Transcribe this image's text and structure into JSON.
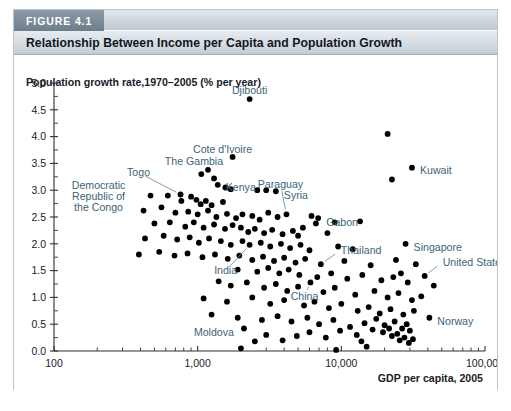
{
  "figure": {
    "tag": "FIGURE 4.1",
    "title": "Relationship Between Income per Capita and Population Growth"
  },
  "chart_data": {
    "type": "scatter",
    "title": "Relationship Between Income per Capita and Population Growth",
    "xlabel": "GDP per capita, 2005",
    "ylabel": "Population growth rate,1970–2005 (% per year)",
    "xscale": "log",
    "xlim": [
      100,
      100000
    ],
    "ylim": [
      0.0,
      5.0
    ],
    "grid": false,
    "legend": null,
    "xticks": [
      100,
      1000,
      10000,
      100000
    ],
    "xtick_labels": [
      "100",
      "1,000",
      "10,000",
      "100,000"
    ],
    "yticks": [
      0.0,
      0.5,
      1.0,
      1.5,
      2.0,
      2.5,
      3.0,
      3.5,
      4.0,
      4.5,
      5.0
    ],
    "ytick_labels": [
      "0.0",
      "0.5",
      "1.0",
      "1.5",
      "2.0",
      "2.5",
      "3.0",
      "3.5",
      "4.0",
      "4.5",
      "5.0"
    ],
    "annotations": [
      {
        "text": "Djibouti",
        "x": 2300,
        "y": 4.7,
        "label_dx": 0,
        "label_dy": -9,
        "anchor": "middle",
        "leader": false
      },
      {
        "text": "Cote d'Ivoire",
        "x": 1750,
        "y": 3.62,
        "label_dx": -10,
        "label_dy": -8,
        "anchor": "middle",
        "leader": false
      },
      {
        "text": "The Gambia",
        "x": 1180,
        "y": 3.38,
        "label_dx": -14,
        "label_dy": -8,
        "anchor": "middle",
        "leader": false
      },
      {
        "text": "Kuwait",
        "x": 31000,
        "y": 3.42,
        "label_dx": 8,
        "label_dy": 3,
        "anchor": "start",
        "leader": false
      },
      {
        "text": "Togo",
        "x": 760,
        "y": 2.92,
        "label_dx": -42,
        "label_dy": -22,
        "anchor": "middle",
        "leader": true
      },
      {
        "text": "Kenya",
        "x": 1380,
        "y": 3.1,
        "label_dx": 8,
        "label_dy": 3,
        "anchor": "start",
        "leader": false
      },
      {
        "text": "Syria",
        "x": 3500,
        "y": 2.98,
        "label_dx": 8,
        "label_dy": 4,
        "anchor": "start",
        "leader": false
      },
      {
        "text": "Paraguay",
        "x": 4150,
        "y": 2.55,
        "label_dx": -6,
        "label_dy": -30,
        "anchor": "middle",
        "leader": true
      },
      {
        "text": "Democratic",
        "x": 470,
        "y": 2.9,
        "label_dx": -52,
        "label_dy": -10,
        "anchor": "middle",
        "leader": false
      },
      {
        "text": "Republic of",
        "x": 470,
        "y": 2.9,
        "label_dx": -52,
        "label_dy": 1,
        "anchor": "middle",
        "leader": false
      },
      {
        "text": "the Congo",
        "x": 470,
        "y": 2.9,
        "label_dx": -52,
        "label_dy": 12,
        "anchor": "middle",
        "leader": false
      },
      {
        "text": "Gabon",
        "x": 6900,
        "y": 2.48,
        "label_dx": 8,
        "label_dy": 4,
        "anchor": "start",
        "leader": false
      },
      {
        "text": "Singapore",
        "x": 28000,
        "y": 2.0,
        "label_dx": 8,
        "label_dy": 4,
        "anchor": "start",
        "leader": false
      },
      {
        "text": "Thailand",
        "x": 7200,
        "y": 1.62,
        "label_dx": 20,
        "label_dy": -14,
        "anchor": "start",
        "leader": true
      },
      {
        "text": "United States",
        "x": 38000,
        "y": 1.4,
        "label_dx": 18,
        "label_dy": -14,
        "anchor": "start",
        "leader": true
      },
      {
        "text": "India",
        "x": 2300,
        "y": 1.98,
        "label_dx": -24,
        "label_dy": 26,
        "anchor": "middle",
        "leader": true
      },
      {
        "text": "China",
        "x": 6100,
        "y": 1.28,
        "label_dx": -6,
        "label_dy": 14,
        "anchor": "middle",
        "leader": true
      },
      {
        "text": "Norway",
        "x": 41000,
        "y": 0.62,
        "label_dx": 8,
        "label_dy": 4,
        "anchor": "start",
        "leader": false
      },
      {
        "text": "Moldova",
        "x": 2100,
        "y": 0.42,
        "label_dx": -10,
        "label_dy": 4,
        "anchor": "end",
        "leader": false
      }
    ],
    "points": [
      {
        "x": 2300,
        "y": 4.7,
        "name": "Djibouti"
      },
      {
        "x": 21000,
        "y": 4.05
      },
      {
        "x": 1750,
        "y": 3.62,
        "name": "Cote d'Ivoire"
      },
      {
        "x": 31000,
        "y": 3.42,
        "name": "Kuwait"
      },
      {
        "x": 22500,
        "y": 3.2
      },
      {
        "x": 1180,
        "y": 3.38,
        "name": "The Gambia"
      },
      {
        "x": 1060,
        "y": 3.3
      },
      {
        "x": 1300,
        "y": 3.22
      },
      {
        "x": 1380,
        "y": 3.1,
        "name": "Kenya"
      },
      {
        "x": 1560,
        "y": 3.05
      },
      {
        "x": 1700,
        "y": 3.02
      },
      {
        "x": 2600,
        "y": 3.0
      },
      {
        "x": 3000,
        "y": 3.0
      },
      {
        "x": 3500,
        "y": 2.98,
        "name": "Syria"
      },
      {
        "x": 470,
        "y": 2.9,
        "name": "Democratic Republic of the Congo"
      },
      {
        "x": 620,
        "y": 2.9
      },
      {
        "x": 760,
        "y": 2.92,
        "name": "Togo"
      },
      {
        "x": 770,
        "y": 2.8
      },
      {
        "x": 900,
        "y": 2.88
      },
      {
        "x": 980,
        "y": 2.82
      },
      {
        "x": 1050,
        "y": 2.74
      },
      {
        "x": 1140,
        "y": 2.8
      },
      {
        "x": 1250,
        "y": 2.72
      },
      {
        "x": 1500,
        "y": 2.78
      },
      {
        "x": 420,
        "y": 2.62
      },
      {
        "x": 560,
        "y": 2.68
      },
      {
        "x": 700,
        "y": 2.58
      },
      {
        "x": 860,
        "y": 2.6
      },
      {
        "x": 1000,
        "y": 2.55
      },
      {
        "x": 1180,
        "y": 2.62
      },
      {
        "x": 1350,
        "y": 2.5
      },
      {
        "x": 1600,
        "y": 2.56
      },
      {
        "x": 1850,
        "y": 2.48
      },
      {
        "x": 2050,
        "y": 2.55
      },
      {
        "x": 2400,
        "y": 2.52
      },
      {
        "x": 2700,
        "y": 2.45
      },
      {
        "x": 3100,
        "y": 2.58
      },
      {
        "x": 3600,
        "y": 2.5
      },
      {
        "x": 4150,
        "y": 2.55,
        "name": "Paraguay"
      },
      {
        "x": 6200,
        "y": 2.52
      },
      {
        "x": 6900,
        "y": 2.48,
        "name": "Gabon"
      },
      {
        "x": 6650,
        "y": 2.38
      },
      {
        "x": 9000,
        "y": 2.4
      },
      {
        "x": 13500,
        "y": 2.42
      },
      {
        "x": 500,
        "y": 2.38
      },
      {
        "x": 640,
        "y": 2.4
      },
      {
        "x": 820,
        "y": 2.32
      },
      {
        "x": 940,
        "y": 2.4
      },
      {
        "x": 1100,
        "y": 2.3
      },
      {
        "x": 1300,
        "y": 2.36
      },
      {
        "x": 1550,
        "y": 2.28
      },
      {
        "x": 1750,
        "y": 2.35
      },
      {
        "x": 2000,
        "y": 2.3
      },
      {
        "x": 2250,
        "y": 2.22
      },
      {
        "x": 2500,
        "y": 2.28
      },
      {
        "x": 2900,
        "y": 2.2
      },
      {
        "x": 3300,
        "y": 2.26
      },
      {
        "x": 3900,
        "y": 2.18
      },
      {
        "x": 4600,
        "y": 2.24
      },
      {
        "x": 5400,
        "y": 2.3
      },
      {
        "x": 5000,
        "y": 2.15
      },
      {
        "x": 8000,
        "y": 2.2
      },
      {
        "x": 28000,
        "y": 2.0,
        "name": "Singapore"
      },
      {
        "x": 430,
        "y": 2.1
      },
      {
        "x": 580,
        "y": 2.15
      },
      {
        "x": 720,
        "y": 2.08
      },
      {
        "x": 880,
        "y": 2.12
      },
      {
        "x": 1020,
        "y": 2.02
      },
      {
        "x": 1200,
        "y": 2.1
      },
      {
        "x": 1450,
        "y": 2.05
      },
      {
        "x": 1700,
        "y": 1.98
      },
      {
        "x": 2300,
        "y": 1.98,
        "name": "India"
      },
      {
        "x": 2050,
        "y": 2.05
      },
      {
        "x": 2750,
        "y": 2.02
      },
      {
        "x": 3200,
        "y": 1.95
      },
      {
        "x": 3800,
        "y": 2.0
      },
      {
        "x": 4400,
        "y": 1.92
      },
      {
        "x": 5200,
        "y": 1.98
      },
      {
        "x": 6000,
        "y": 1.88
      },
      {
        "x": 9500,
        "y": 1.95
      },
      {
        "x": 12000,
        "y": 1.9
      },
      {
        "x": 390,
        "y": 1.8
      },
      {
        "x": 540,
        "y": 1.85
      },
      {
        "x": 690,
        "y": 1.78
      },
      {
        "x": 850,
        "y": 1.82
      },
      {
        "x": 1080,
        "y": 1.75
      },
      {
        "x": 1320,
        "y": 1.8
      },
      {
        "x": 1620,
        "y": 1.72
      },
      {
        "x": 1950,
        "y": 1.78
      },
      {
        "x": 2400,
        "y": 1.7
      },
      {
        "x": 2850,
        "y": 1.76
      },
      {
        "x": 3400,
        "y": 1.68
      },
      {
        "x": 4000,
        "y": 1.74
      },
      {
        "x": 4800,
        "y": 1.65
      },
      {
        "x": 5600,
        "y": 1.72
      },
      {
        "x": 7200,
        "y": 1.62,
        "name": "Thailand"
      },
      {
        "x": 10500,
        "y": 1.68
      },
      {
        "x": 16000,
        "y": 1.6
      },
      {
        "x": 24000,
        "y": 1.7
      },
      {
        "x": 33000,
        "y": 1.62
      },
      {
        "x": 38000,
        "y": 1.4,
        "name": "United States"
      },
      {
        "x": 26000,
        "y": 1.45
      },
      {
        "x": 1900,
        "y": 1.52
      },
      {
        "x": 2600,
        "y": 1.48
      },
      {
        "x": 3100,
        "y": 1.55
      },
      {
        "x": 3700,
        "y": 1.45
      },
      {
        "x": 4300,
        "y": 1.52
      },
      {
        "x": 5100,
        "y": 1.42
      },
      {
        "x": 6100,
        "y": 1.28,
        "name": "China"
      },
      {
        "x": 6800,
        "y": 1.38
      },
      {
        "x": 8500,
        "y": 1.45
      },
      {
        "x": 11000,
        "y": 1.35
      },
      {
        "x": 14000,
        "y": 1.42
      },
      {
        "x": 19000,
        "y": 1.32
      },
      {
        "x": 23000,
        "y": 1.38
      },
      {
        "x": 29000,
        "y": 1.28
      },
      {
        "x": 44000,
        "y": 1.22
      },
      {
        "x": 1400,
        "y": 1.3
      },
      {
        "x": 1700,
        "y": 1.22
      },
      {
        "x": 2200,
        "y": 1.28
      },
      {
        "x": 2900,
        "y": 1.18
      },
      {
        "x": 3500,
        "y": 1.25
      },
      {
        "x": 4200,
        "y": 1.12
      },
      {
        "x": 5000,
        "y": 1.2
      },
      {
        "x": 7500,
        "y": 1.1
      },
      {
        "x": 9000,
        "y": 1.18
      },
      {
        "x": 12500,
        "y": 1.05
      },
      {
        "x": 17000,
        "y": 1.12
      },
      {
        "x": 21000,
        "y": 1.0
      },
      {
        "x": 25000,
        "y": 1.08
      },
      {
        "x": 31000,
        "y": 0.95
      },
      {
        "x": 36000,
        "y": 1.02
      },
      {
        "x": 1100,
        "y": 0.98
      },
      {
        "x": 1600,
        "y": 0.92
      },
      {
        "x": 2400,
        "y": 1.0
      },
      {
        "x": 3200,
        "y": 0.88
      },
      {
        "x": 4000,
        "y": 0.95
      },
      {
        "x": 5500,
        "y": 0.85
      },
      {
        "x": 6500,
        "y": 0.92
      },
      {
        "x": 8200,
        "y": 0.8
      },
      {
        "x": 10000,
        "y": 0.88
      },
      {
        "x": 13000,
        "y": 0.75
      },
      {
        "x": 15500,
        "y": 0.82
      },
      {
        "x": 18500,
        "y": 0.7
      },
      {
        "x": 22000,
        "y": 0.78
      },
      {
        "x": 27000,
        "y": 0.68
      },
      {
        "x": 32000,
        "y": 0.75
      },
      {
        "x": 41000,
        "y": 0.62,
        "name": "Norway"
      },
      {
        "x": 1250,
        "y": 0.68
      },
      {
        "x": 1900,
        "y": 0.62
      },
      {
        "x": 2100,
        "y": 0.42,
        "name": "Moldova"
      },
      {
        "x": 2800,
        "y": 0.58
      },
      {
        "x": 3600,
        "y": 0.65
      },
      {
        "x": 4500,
        "y": 0.55
      },
      {
        "x": 5800,
        "y": 0.62
      },
      {
        "x": 7000,
        "y": 0.5
      },
      {
        "x": 8800,
        "y": 0.58
      },
      {
        "x": 11500,
        "y": 0.45
      },
      {
        "x": 14500,
        "y": 0.52
      },
      {
        "x": 17500,
        "y": 0.6
      },
      {
        "x": 20000,
        "y": 0.48
      },
      {
        "x": 23500,
        "y": 0.55
      },
      {
        "x": 26500,
        "y": 0.42
      },
      {
        "x": 28500,
        "y": 0.5
      },
      {
        "x": 30000,
        "y": 0.38
      },
      {
        "x": 24500,
        "y": 0.32
      },
      {
        "x": 22500,
        "y": 0.28
      },
      {
        "x": 21500,
        "y": 0.42
      },
      {
        "x": 19500,
        "y": 0.35
      },
      {
        "x": 16500,
        "y": 0.4
      },
      {
        "x": 12800,
        "y": 0.3
      },
      {
        "x": 9800,
        "y": 0.38
      },
      {
        "x": 7800,
        "y": 0.25
      },
      {
        "x": 6000,
        "y": 0.35
      },
      {
        "x": 4900,
        "y": 0.28
      },
      {
        "x": 3900,
        "y": 0.2
      },
      {
        "x": 3000,
        "y": 0.3
      },
      {
        "x": 2500,
        "y": 0.18
      },
      {
        "x": 9200,
        "y": 0.02
      },
      {
        "x": 25500,
        "y": 0.2
      },
      {
        "x": 27500,
        "y": 0.25
      },
      {
        "x": 29500,
        "y": 0.15
      },
      {
        "x": 31500,
        "y": 0.22
      },
      {
        "x": 2000,
        "y": 0.05
      },
      {
        "x": 13800,
        "y": 0.18
      },
      {
        "x": 15000,
        "y": 0.08
      }
    ]
  }
}
